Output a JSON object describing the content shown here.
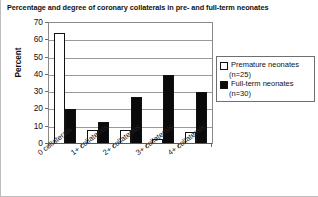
{
  "chart_data": {
    "type": "bar",
    "title": "Percentage and degree of coronary collaterals in pre- and full-term neonates",
    "xlabel": "",
    "ylabel": "Percent",
    "ylim": [
      0,
      70
    ],
    "ytick_step": 10,
    "yticks": [
      "70",
      "60",
      "50",
      "40",
      "30",
      "20",
      "10",
      "0"
    ],
    "grid": true,
    "legend_position": "right",
    "categories": [
      "0 collaterals",
      "1+ collaterals",
      "2+ collaterals",
      "3+ collaterals",
      "4+ collaterals"
    ],
    "series": [
      {
        "name": "Premature neonates",
        "legend_label": "Premature neonates",
        "legend_sublabel": "(n=25)",
        "n": 25,
        "color": "#ffffff",
        "values": [
          64,
          8,
          8,
          3,
          7
        ]
      },
      {
        "name": "Full-term neonates",
        "legend_label": "Full-term neonates",
        "legend_sublabel": "(n=30)",
        "n": 30,
        "color": "#0a0a0a",
        "values": [
          20,
          13,
          27,
          40,
          30
        ]
      }
    ]
  }
}
